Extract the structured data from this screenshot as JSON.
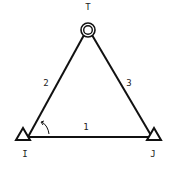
{
  "diagram": {
    "nodes": [
      {
        "id": "T",
        "label": "T",
        "type": "target-circle"
      },
      {
        "id": "I",
        "label": "I",
        "type": "support-triangle"
      },
      {
        "id": "J",
        "label": "J",
        "type": "support-triangle"
      }
    ],
    "edges": [
      {
        "id": "1",
        "label": "1",
        "from": "I",
        "to": "J"
      },
      {
        "id": "2",
        "label": "2",
        "from": "I",
        "to": "T"
      },
      {
        "id": "3",
        "label": "3",
        "from": "J",
        "to": "T"
      }
    ],
    "angle_marker": "angle at I"
  }
}
